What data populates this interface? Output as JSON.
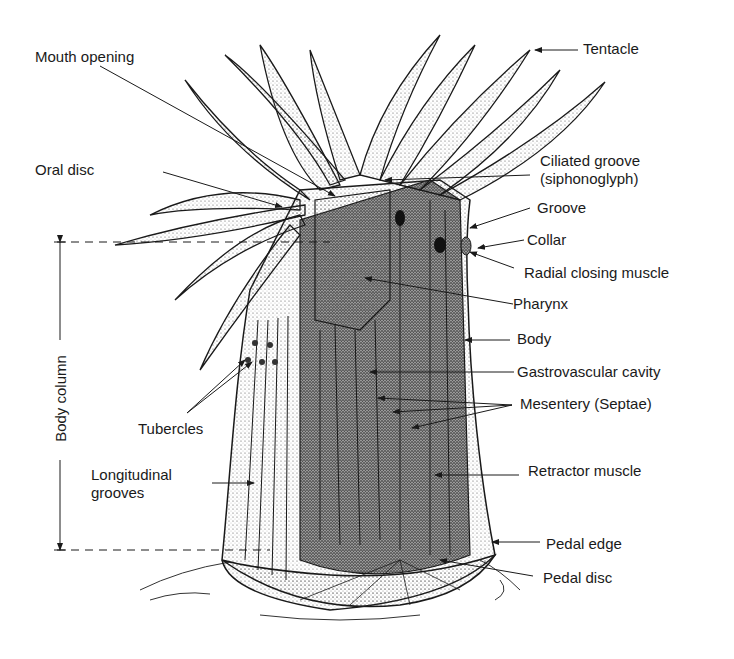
{
  "diagram": {
    "labels": {
      "mouth_opening": "Mouth opening",
      "oral_disc": "Oral disc",
      "tentacle": "Tentacle",
      "ciliated_groove_1": "Ciliated groove",
      "ciliated_groove_2": "(siphonoglyph)",
      "groove": "Groove",
      "collar": "Collar",
      "radial_closing_muscle": "Radial closing muscle",
      "pharynx": "Pharynx",
      "body": "Body",
      "gastrovascular_cavity": "Gastrovascular cavity",
      "mesentery": "Mesentery (Septae)",
      "tubercles": "Tubercles",
      "longitudinal_grooves_1": "Longitudinal",
      "longitudinal_grooves_2": "grooves",
      "retractor_muscle": "Retractor muscle",
      "pedal_edge": "Pedal edge",
      "pedal_disc": "Pedal disc",
      "body_column": "Body column"
    },
    "colors": {
      "ink": "#1a1a1a",
      "stipple_dark": "#3a3a3a",
      "stipple_light": "#bdbdbd",
      "background": "#ffffff"
    }
  }
}
